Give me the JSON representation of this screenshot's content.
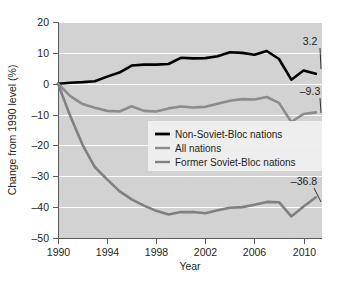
{
  "figure": {
    "background_color": "#ffffff",
    "plot_background_color": "#d2d2d2",
    "gridline_color": "#ffffff",
    "axis_color": "#5b5b5b"
  },
  "chart_data": {
    "type": "line",
    "title": "",
    "xlabel": "Year",
    "ylabel": "Change from 1990 level (%)",
    "xlim": [
      1990,
      2011.5
    ],
    "ylim": [
      -50,
      20
    ],
    "xticks": [
      1990,
      1994,
      1998,
      2002,
      2006,
      2010
    ],
    "xticklabels": [
      "1990",
      "1994",
      "1998",
      "2002",
      "2006",
      "2010"
    ],
    "yticks": [
      20,
      10,
      0,
      -10,
      -20,
      -30,
      -40,
      -50
    ],
    "yticklabels": [
      "20",
      "10",
      "0",
      "–10",
      "–20",
      "–30",
      "–40",
      "–50"
    ],
    "grid": "horizontal",
    "legend_position": "center-right",
    "x": [
      1990,
      1991,
      1992,
      1993,
      1994,
      1995,
      1996,
      1997,
      1998,
      1999,
      2000,
      2001,
      2002,
      2003,
      2004,
      2005,
      2006,
      2007,
      2008,
      2009,
      2010,
      2011
    ],
    "series": [
      {
        "name": "Non-Soviet-Bloc nations",
        "color": "#000000",
        "width": 2.6,
        "end_label": "3.2",
        "values": [
          0.0,
          0.3,
          0.5,
          0.8,
          2.3,
          3.6,
          5.9,
          6.2,
          6.2,
          6.4,
          8.4,
          8.2,
          8.3,
          8.9,
          10.2,
          10.0,
          9.4,
          10.6,
          8.0,
          1.3,
          4.3,
          3.2
        ]
      },
      {
        "name": "All nations",
        "color": "#8c8c8c",
        "width": 2.6,
        "end_label": "–9.3",
        "values": [
          0.0,
          -4.0,
          -6.6,
          -7.8,
          -8.8,
          -9.0,
          -7.3,
          -8.8,
          -9.0,
          -8.0,
          -7.4,
          -7.7,
          -7.5,
          -6.5,
          -5.5,
          -5.0,
          -5.1,
          -4.3,
          -6.2,
          -12.4,
          -9.8,
          -9.3
        ]
      },
      {
        "name": "Former Soviet-Bloc nations",
        "color": "#808080",
        "width": 2.6,
        "end_label": "–36.8",
        "values": [
          0.0,
          -10.5,
          -19.8,
          -27.0,
          -31.0,
          -34.8,
          -37.5,
          -39.5,
          -41.2,
          -42.4,
          -41.6,
          -41.6,
          -42.0,
          -41.0,
          -40.2,
          -40.0,
          -39.2,
          -38.3,
          -38.4,
          -43.0,
          -39.8,
          -36.8
        ]
      }
    ],
    "annotations": [
      {
        "text": "3.2",
        "series": "Non-Soviet-Bloc nations"
      },
      {
        "text": "–9.3",
        "series": "All nations"
      },
      {
        "text": "–36.8",
        "series": "Former Soviet-Bloc nations"
      }
    ]
  },
  "legend": {
    "items": [
      {
        "label": "Non-Soviet-Bloc nations",
        "color": "#000000"
      },
      {
        "label": "All nations",
        "color": "#8c8c8c"
      },
      {
        "label": "Former Soviet-Bloc nations",
        "color": "#808080"
      }
    ]
  }
}
